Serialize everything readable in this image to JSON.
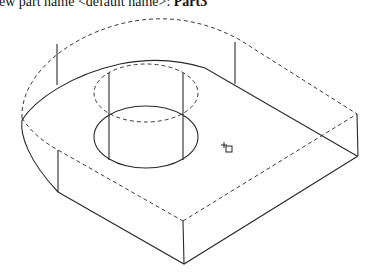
{
  "command_line": {
    "prompt": "ew part name <default name>: ",
    "value": "Part3"
  },
  "viewport": {
    "background": "#ffffff",
    "line_color": "#2a2a2a",
    "view": "isometric wireframe",
    "model": "base plate with rounded end and through-hole"
  },
  "cursor": {
    "icon": "pick-box-cursor-icon",
    "x": 228,
    "y": 147
  }
}
